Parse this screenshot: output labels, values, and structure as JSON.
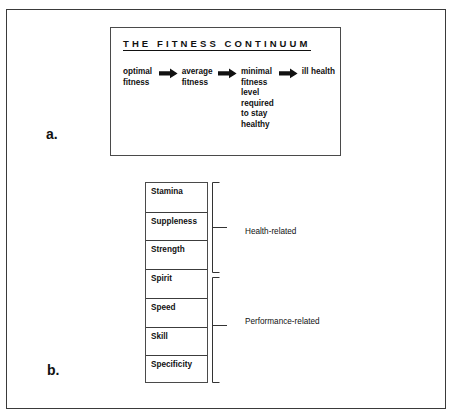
{
  "figure": {
    "panel_a": {
      "label": "a.",
      "box": {
        "title": "THE FITNESS CONTINUUM",
        "stages": [
          {
            "text": "optimal\nfitness",
            "lines": [
              "optimal",
              "fitness"
            ]
          },
          {
            "text": "average\nfitness",
            "lines": [
              "average",
              "fitness"
            ]
          },
          {
            "text": "minimal fitness level required to stay healthy",
            "lines": [
              "minimal",
              "fitness",
              "level",
              "required",
              "to stay",
              "healthy"
            ]
          },
          {
            "text": "ill health",
            "lines": [
              "ill health"
            ]
          }
        ],
        "arrows": [
          "arrow-right-icon",
          "arrow-right-icon",
          "arrow-right-icon"
        ]
      }
    },
    "panel_b": {
      "label": "b.",
      "items": [
        "Stamina",
        "Suppleness",
        "Strength",
        "Spirit",
        "Speed",
        "Skill",
        "Specificity"
      ],
      "groups": [
        {
          "label": "Health-related",
          "items": [
            "Stamina",
            "Suppleness",
            "Strength",
            "Spirit"
          ]
        },
        {
          "label": "Performance-related",
          "items": [
            "Speed",
            "Skill",
            "Specificity"
          ]
        }
      ]
    }
  },
  "colors": {
    "ink": "#111111",
    "frame": "#3a3a3a",
    "box_border": "#4a4a4a",
    "background": "#ffffff"
  }
}
